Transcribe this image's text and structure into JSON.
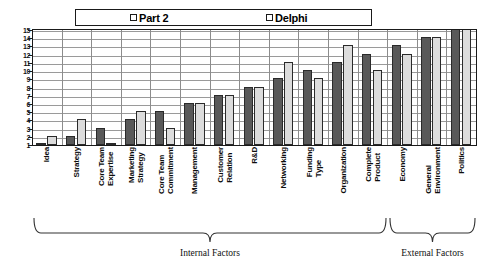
{
  "chart_data": {
    "type": "bar",
    "title": "",
    "subtitle": "",
    "xlabel": "",
    "ylabel": "",
    "ylim": [
      1,
      15
    ],
    "y_ticks": [
      15,
      14,
      13,
      12,
      11,
      10,
      9,
      8,
      7,
      6,
      5,
      4,
      3,
      2,
      1
    ],
    "y_tick_labels": [
      "15",
      "14",
      "13",
      "12",
      "11",
      "10",
      "9",
      "8",
      "7",
      "6",
      "5",
      "4",
      "3",
      "2",
      "1"
    ],
    "grid": true,
    "legend_position": "top",
    "categories": [
      "Idea",
      "Strategy",
      "Core Team Expertise",
      "Marketing Strategy",
      "Core Team Commitment",
      "Management",
      "Customer Relation",
      "R&D",
      "Networking",
      "Funding Type",
      "Organization",
      "Complete Product",
      "Economy",
      "General Environment",
      "Politics"
    ],
    "category_lines": [
      [
        "Idea",
        ""
      ],
      [
        "Strategy",
        ""
      ],
      [
        "Core Team",
        "Expertise"
      ],
      [
        "Marketing",
        "Strategy"
      ],
      [
        "Core Team",
        "Commitment"
      ],
      [
        "Management",
        ""
      ],
      [
        "Customer",
        "Relation"
      ],
      [
        "R&D",
        ""
      ],
      [
        "Networking",
        ""
      ],
      [
        "Funding",
        "Type"
      ],
      [
        "Organization",
        ""
      ],
      [
        "Complete",
        "Product"
      ],
      [
        "Economy",
        ""
      ],
      [
        "General",
        "Environment"
      ],
      [
        "Politics",
        ""
      ]
    ],
    "series": [
      {
        "name": "Part 2",
        "color": "#595959",
        "values": [
          1,
          2,
          3,
          4,
          5,
          6,
          7,
          8,
          9,
          10,
          11,
          12,
          13,
          14,
          15
        ]
      },
      {
        "name": "Delphi",
        "color": "#dcdcdc",
        "values": [
          2,
          4,
          1,
          5,
          3,
          6,
          7,
          8,
          11,
          9,
          13,
          10,
          12,
          14,
          15
        ]
      }
    ],
    "annotations": [
      {
        "label": "Internal Factors",
        "span_start": 0,
        "span_end": 11
      },
      {
        "label": "External Factors",
        "span_start": 12,
        "span_end": 14
      }
    ]
  },
  "legend": {
    "entries": [
      {
        "label": "Part 2",
        "swatch_color": "#595959"
      },
      {
        "label": "Delphi",
        "swatch_color": "#e8e8e8"
      }
    ]
  },
  "brackets": {
    "internal": "Internal Factors",
    "external": "External Factors"
  }
}
